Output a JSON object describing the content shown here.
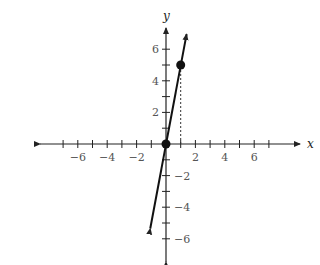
{
  "chart_data": {
    "type": "line",
    "title": "",
    "xlabel": "x",
    "ylabel": "y",
    "xlim": [
      -8,
      9
    ],
    "ylim": [
      -7,
      7
    ],
    "grid": false,
    "x_ticks": [
      -7,
      -6,
      -5,
      -4,
      -3,
      -2,
      -1,
      1,
      2,
      3,
      4,
      5,
      6,
      7
    ],
    "x_tick_labels": [
      {
        "value": -6,
        "label": "−6"
      },
      {
        "value": -4,
        "label": "−4"
      },
      {
        "value": -2,
        "label": "−2"
      },
      {
        "value": 2,
        "label": "2"
      },
      {
        "value": 4,
        "label": "4"
      },
      {
        "value": 6,
        "label": "6"
      }
    ],
    "y_ticks": [
      -6,
      -5,
      -4,
      -3,
      -2,
      -1,
      1,
      2,
      3,
      4,
      5,
      6
    ],
    "y_tick_labels": [
      {
        "value": 6,
        "label": "6"
      },
      {
        "value": 4,
        "label": "4"
      },
      {
        "value": 2,
        "label": "2"
      },
      {
        "value": -2,
        "label": "−2"
      },
      {
        "value": -4,
        "label": "−4"
      },
      {
        "value": -6,
        "label": "−6"
      }
    ],
    "series": [
      {
        "name": "y = 5x",
        "kind": "line-with-arrows",
        "x": [
          -1.07,
          1.4
        ],
        "y": [
          -5.35,
          6.95
        ]
      }
    ],
    "points": [
      {
        "x": 0,
        "y": 0,
        "label": "origin point"
      },
      {
        "x": 1,
        "y": 5,
        "label": "point (1, 5)"
      }
    ],
    "annotations": [
      {
        "type": "dashed-vertical",
        "x": 1,
        "y_from": 0,
        "y_to": 5
      }
    ]
  },
  "axes": {
    "x_label": "x",
    "y_label": "y"
  }
}
